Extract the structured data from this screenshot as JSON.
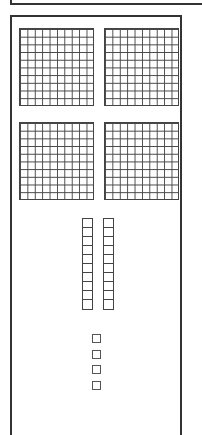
{
  "diagram": {
    "type": "base-ten-blocks",
    "represented_value": 424,
    "hundreds": {
      "count": 4,
      "grid": "10x10"
    },
    "tens": {
      "count": 2,
      "cells_per_rod": 10
    },
    "ones": {
      "count": 4
    },
    "colors": {
      "line": "#333333",
      "background": "#ffffff"
    }
  }
}
